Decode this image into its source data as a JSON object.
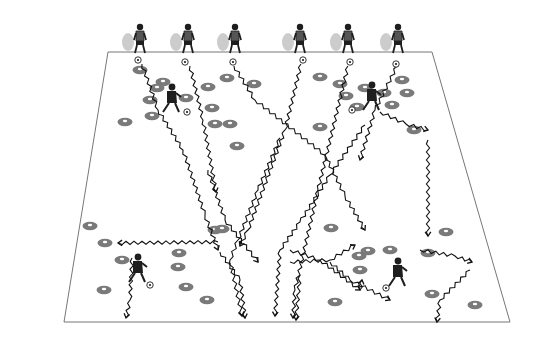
{
  "diagram": {
    "type": "soccer-drill",
    "colors": {
      "field_line": "#777777",
      "cone": "#7a7a7a",
      "cone_top": "#ffffff",
      "player": "#1e1e1e",
      "player_ghost": "#cccccc",
      "path": "#111111"
    },
    "field": {
      "points": [
        [
          108,
          52
        ],
        [
          432,
          52
        ],
        [
          510,
          322
        ],
        [
          64,
          322
        ]
      ]
    },
    "top_players": [
      [
        140,
        38
      ],
      [
        188,
        38
      ],
      [
        235,
        38
      ],
      [
        300,
        38
      ],
      [
        348,
        38
      ],
      [
        398,
        38
      ]
    ],
    "top_balls": [
      [
        138,
        60
      ],
      [
        185,
        62
      ],
      [
        233,
        62
      ],
      [
        303,
        60
      ],
      [
        350,
        62
      ],
      [
        396,
        64
      ]
    ],
    "dribblers": [
      [
        172,
        98
      ],
      [
        372,
        96
      ],
      [
        138,
        268
      ],
      [
        398,
        272
      ]
    ],
    "dribbler_balls": [
      [
        187,
        112
      ],
      [
        352,
        110
      ],
      [
        150,
        285
      ],
      [
        386,
        288
      ]
    ],
    "cones": [
      [
        140,
        70
      ],
      [
        163,
        82
      ],
      [
        150,
        100
      ],
      [
        125,
        122
      ],
      [
        152,
        116
      ],
      [
        157,
        88
      ],
      [
        186,
        98
      ],
      [
        208,
        87
      ],
      [
        212,
        108
      ],
      [
        215,
        124
      ],
      [
        227,
        78
      ],
      [
        254,
        84
      ],
      [
        320,
        77
      ],
      [
        340,
        84
      ],
      [
        346,
        96
      ],
      [
        357,
        107
      ],
      [
        365,
        88
      ],
      [
        384,
        93
      ],
      [
        392,
        105
      ],
      [
        402,
        80
      ],
      [
        407,
        93
      ],
      [
        414,
        130
      ],
      [
        320,
        127
      ],
      [
        230,
        124
      ],
      [
        237,
        146
      ],
      [
        90,
        226
      ],
      [
        105,
        243
      ],
      [
        122,
        260
      ],
      [
        104,
        290
      ],
      [
        179,
        253
      ],
      [
        186,
        287
      ],
      [
        178,
        267
      ],
      [
        215,
        230
      ],
      [
        207,
        300
      ],
      [
        331,
        228
      ],
      [
        359,
        256
      ],
      [
        360,
        270
      ],
      [
        368,
        251
      ],
      [
        390,
        250
      ],
      [
        428,
        253
      ],
      [
        446,
        232
      ],
      [
        475,
        305
      ],
      [
        432,
        294
      ],
      [
        335,
        302
      ],
      [
        222,
        229
      ]
    ],
    "paths": [
      [
        [
          142,
          64
        ],
        [
          158,
          110
        ],
        [
          183,
          150
        ],
        [
          205,
          215
        ],
        [
          218,
          250
        ]
      ],
      [
        [
          190,
          66
        ],
        [
          203,
          120
        ],
        [
          216,
          192
        ]
      ],
      [
        [
          234,
          66
        ],
        [
          255,
          100
        ],
        [
          325,
          155
        ],
        [
          345,
          196
        ],
        [
          365,
          230
        ]
      ],
      [
        [
          301,
          64
        ],
        [
          285,
          130
        ],
        [
          248,
          230
        ],
        [
          240,
          246
        ]
      ],
      [
        [
          348,
          66
        ],
        [
          318,
          190
        ],
        [
          295,
          290
        ],
        [
          293,
          318
        ]
      ],
      [
        [
          397,
          66
        ],
        [
          375,
          110
        ],
        [
          360,
          160
        ]
      ],
      [
        [
          208,
          170
        ],
        [
          225,
          220
        ],
        [
          258,
          262
        ]
      ],
      [
        [
          280,
          138
        ],
        [
          258,
          190
        ],
        [
          238,
          240
        ],
        [
          230,
          260
        ],
        [
          242,
          316
        ]
      ],
      [
        [
          365,
          125
        ],
        [
          330,
          175
        ],
        [
          300,
          222
        ],
        [
          280,
          250
        ],
        [
          275,
          316
        ]
      ],
      [
        [
          380,
          112
        ],
        [
          406,
          124
        ],
        [
          428,
          130
        ]
      ],
      [
        [
          428,
          140
        ],
        [
          428,
          236
        ]
      ],
      [
        [
          218,
          242
        ],
        [
          118,
          243
        ]
      ],
      [
        [
          132,
          258
        ],
        [
          130,
          300
        ],
        [
          126,
          318
        ]
      ],
      [
        [
          220,
          252
        ],
        [
          240,
          280
        ],
        [
          245,
          318
        ]
      ],
      [
        [
          290,
          262
        ],
        [
          330,
          260
        ],
        [
          355,
          245
        ]
      ],
      [
        [
          290,
          250
        ],
        [
          320,
          260
        ],
        [
          360,
          290
        ]
      ],
      [
        [
          330,
          262
        ],
        [
          350,
          280
        ],
        [
          390,
          300
        ]
      ],
      [
        [
          300,
          275
        ],
        [
          296,
          320
        ]
      ],
      [
        [
          420,
          250
        ],
        [
          455,
          256
        ],
        [
          472,
          262
        ]
      ],
      [
        [
          470,
          270
        ],
        [
          440,
          300
        ],
        [
          437,
          322
        ]
      ],
      [
        [
          360,
          290
        ],
        [
          362,
          280
        ]
      ]
    ]
  }
}
